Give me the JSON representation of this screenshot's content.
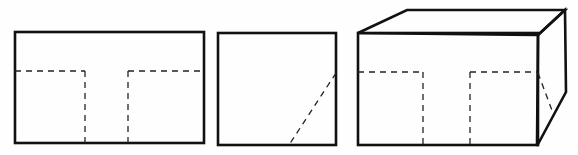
{
  "diagram": {
    "type": "orthographic-and-isometric-projection",
    "colors": {
      "background": "#ffffff",
      "line": "#111111",
      "hidden_line": "#222222"
    },
    "views": [
      {
        "id": "front-view",
        "kind": "front elevation",
        "outline": {
          "x": 15,
          "y": 32,
          "w": 189,
          "h": 111
        },
        "hidden_lines": [
          {
            "x1": 15,
            "y1": 71,
            "x2": 85,
            "y2": 71
          },
          {
            "x1": 85,
            "y1": 71,
            "x2": 85,
            "y2": 143
          },
          {
            "x1": 128,
            "y1": 71,
            "x2": 204,
            "y2": 71
          },
          {
            "x1": 128,
            "y1": 71,
            "x2": 128,
            "y2": 143
          }
        ]
      },
      {
        "id": "side-view",
        "kind": "side elevation",
        "outline": {
          "x": 218,
          "y": 33,
          "w": 118,
          "h": 112
        },
        "hidden_lines": [
          {
            "x1": 336,
            "y1": 73,
            "x2": 289,
            "y2": 145
          }
        ]
      },
      {
        "id": "isometric-view",
        "kind": "pictorial (oblique) view",
        "front_face": {
          "x": 358,
          "y": 33,
          "w": 180,
          "h": 112
        },
        "top_face_points": "358,33 407,10 565,10 538,35",
        "side_face_points": "538,35 565,10 566,92 537,146",
        "hidden_lines": [
          {
            "x1": 358,
            "y1": 72,
            "x2": 423,
            "y2": 72
          },
          {
            "x1": 423,
            "y1": 72,
            "x2": 423,
            "y2": 145
          },
          {
            "x1": 470,
            "y1": 72,
            "x2": 538,
            "y2": 72
          },
          {
            "x1": 470,
            "y1": 72,
            "x2": 470,
            "y2": 145
          },
          {
            "x1": 538,
            "y1": 73,
            "x2": 553,
            "y2": 113
          }
        ]
      }
    ]
  }
}
